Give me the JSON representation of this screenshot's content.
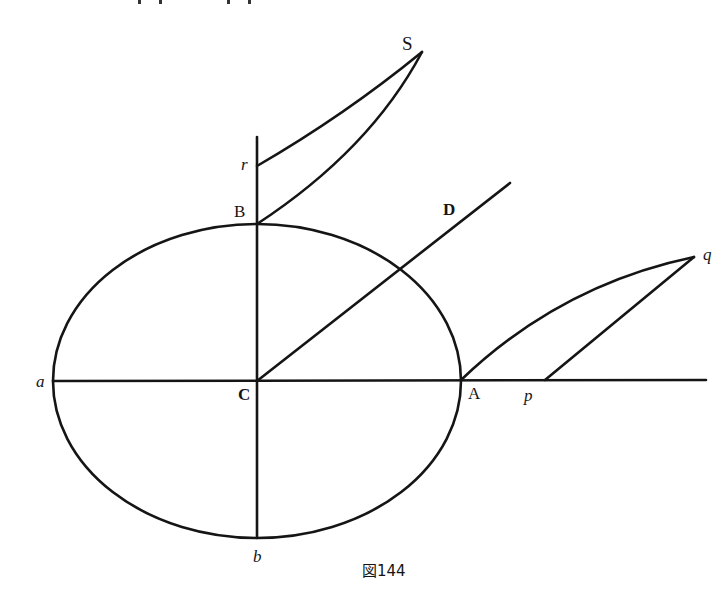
{
  "figure": {
    "caption": "図144",
    "labels": {
      "S": "S",
      "r": "r",
      "B": "B",
      "D": "D",
      "q": "q",
      "a": "a",
      "C": "C",
      "A": "A",
      "p": "p",
      "b": "b"
    }
  },
  "geometry": {
    "ellipse": {
      "cx": 257,
      "cy": 381,
      "rx": 204,
      "ry": 157
    },
    "points": {
      "C": [
        257,
        381
      ],
      "A": [
        461,
        381
      ],
      "a": [
        53,
        381
      ],
      "B": [
        257,
        224
      ],
      "b": [
        257,
        538
      ],
      "r": [
        257,
        166
      ],
      "S": [
        422,
        52
      ],
      "D_end": [
        510,
        183
      ],
      "q": [
        694,
        257
      ],
      "p": [
        545,
        380
      ]
    }
  }
}
